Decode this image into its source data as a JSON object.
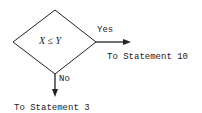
{
  "diagram": {
    "type": "flowchart-decision",
    "decision": {
      "condition": "X ≤ Y",
      "shape": "diamond"
    },
    "branches": [
      {
        "label": "Yes",
        "direction": "right",
        "target": "To Statement 10"
      },
      {
        "label": "No",
        "direction": "down",
        "target": "To Statement 3"
      }
    ],
    "colors": {
      "stroke": "#222222",
      "background": "#ffffff"
    }
  }
}
